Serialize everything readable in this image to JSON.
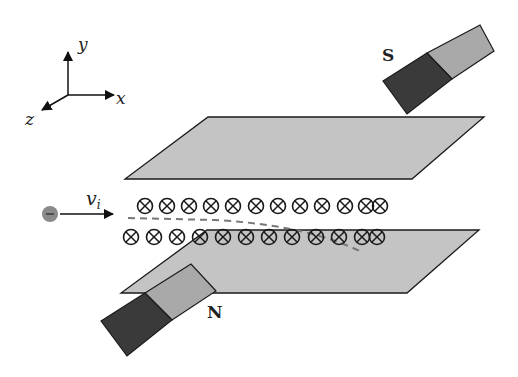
{
  "diagram": {
    "axes": {
      "x_label": "x",
      "y_label": "y",
      "z_label": "z"
    },
    "particle": {
      "charge_symbol": "−",
      "velocity_label": "v",
      "velocity_subscript": "i"
    },
    "magnets": {
      "top_pole": "S",
      "bottom_pole": "N"
    },
    "field_symbol": "⊗",
    "field_rows": 2,
    "colors": {
      "plate_fill": "#c4c4c4",
      "magnet_dark": "#3a3a3a",
      "magnet_light": "#a9a9a9",
      "particle": "#8a8a8a",
      "path_dash": "#777777",
      "stroke": "#1a1a1a"
    }
  }
}
